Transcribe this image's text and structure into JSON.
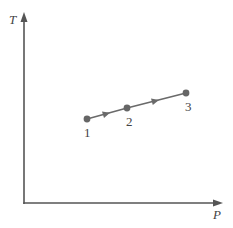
{
  "diagram": {
    "type": "thermodynamic-process-diagram",
    "axes": {
      "x_label": "P",
      "y_label": "T"
    },
    "states": [
      {
        "label": "1",
        "x": 87,
        "y": 119,
        "label_x": 88,
        "label_y": 136
      },
      {
        "label": "2",
        "x": 127,
        "y": 108,
        "label_x": 130,
        "label_y": 126
      },
      {
        "label": "3",
        "x": 186,
        "y": 93,
        "label_x": 189,
        "label_y": 111
      }
    ],
    "process_direction": "1 -> 2 -> 3",
    "colors": {
      "axis": "#555555",
      "line": "#6a6a6a",
      "point": "#666666",
      "text": "#444444"
    }
  }
}
